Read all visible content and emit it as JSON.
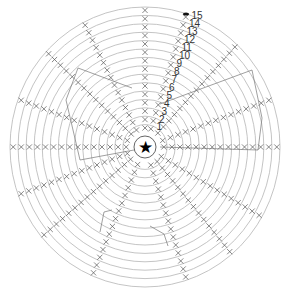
{
  "diagram": {
    "type": "crochet-chart",
    "center_symbol": "star",
    "center": [
      145,
      147
    ],
    "rings": 15,
    "outer_radius": [
      135,
      140
    ],
    "row_numbers": [
      "1",
      "2",
      "3",
      "4",
      "5",
      "6",
      "7",
      "8",
      "9",
      "10",
      "11",
      "12",
      "13",
      "14",
      "15"
    ],
    "row_number_angle_deg": 72,
    "spoke_angles_deg": [
      90,
      72,
      47,
      20,
      0,
      -30,
      -50,
      -72,
      -113,
      -140,
      -160,
      180,
      160,
      137,
      117
    ],
    "ring_stroke_color": "#b5b5b5",
    "stitch_color": "#555555",
    "stitch_symbol": "x",
    "marker_symbol": "dot"
  }
}
